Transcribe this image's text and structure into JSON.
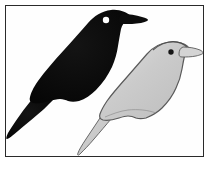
{
  "figure": {
    "caption": "",
    "background_color": "#ffffff",
    "plate_background_color": "#fefefe",
    "frame": {
      "border_color": "#2a2a2a",
      "border_width_px": 1,
      "x": 5,
      "y": 5,
      "width": 199,
      "height": 152
    }
  },
  "subjects": [
    {
      "id": "dark-bird",
      "label": "Dark bird silhouette",
      "fill_color": "#0c0c0c",
      "outline_color": "#0c0c0c",
      "eye_color": "#ffffff",
      "eye_cx": 108,
      "eye_cy": 19,
      "eye_r": 3.1,
      "facing": "right",
      "position": "upper-left",
      "body_path": "M 131 16 C 126 11 118 8 110 9 C 101 10 93 15 87 22 C 80 30 72 39 63 49 C 53 60 44 70 37 80 C 32 87 30 92 28 96 C 26 100 22 104 17 110 C 13 115 10 120 8 125 C 6 129 5 133 5 136 C 5 138 6 139 8 138 C 12 136 18 131 24 126 C 31 120 38 114 44 109 C 49 105 53 102 57 100 C 60 99 63 98 66 98 C 68 98 70 99 72 100 C 75 101 78 101 82 100 C 88 98 94 94 99 89 C 106 82 111 74 115 66 C 118 59 120 52 121 45 C 122 39 123 33 124 28 C 125 24 127 21 131 19 L 131 16 Z",
      "beak_path": "M 126 13 C 132 13 139 14 145 16 C 149 17 151 18 151 19 C 151 20 148 21 144 22 C 138 23 132 23 127 23 C 124 23 122 22 122 20 C 122 17 123 14 126 13 Z"
    },
    {
      "id": "light-bird",
      "label": "Light bird outline",
      "fill_color": "#cfcfcf",
      "outline_color": "#5a5a5a",
      "eye_color": "#151515",
      "eye_cx": 169,
      "eye_cy": 50,
      "eye_r": 2.6,
      "facing": "right",
      "position": "lower-right",
      "body_path": "M 186 48 C 181 43 174 41 167 42 C 159 43 151 47 145 53 C 139 60 132 68 125 76 C 117 85 110 93 105 100 C 101 106 99 110 97 113 C 95 117 91 121 87 126 C 83 131 80 136 78 140 C 76 144 75 147 76 149 C 77 150 78 149 80 147 C 84 143 89 138 95 133 C 101 128 107 123 112 119 C 116 116 120 114 123 113 C 126 112 129 113 131 114 C 134 115 137 115 141 114 C 146 112 152 109 157 104 C 163 98 168 91 171 84 C 174 78 176 71 177 65 C 178 59 179 54 180 50 C 181 47 183 45 186 44 L 186 48 Z",
      "beak_path": "M 181 44 C 187 44 193 45 198 47 C 201 48 203 49 203 50 C 203 51 200 52 196 53 C 191 54 185 54 181 54 C 178 54 177 53 177 51 C 177 48 178 45 181 44 Z"
    }
  ],
  "colors": {
    "page_background": "#ffffff",
    "frame_border": "#2a2a2a",
    "dark_silhouette": "#0c0c0c",
    "light_silhouette_fill": "#cfcfcf",
    "light_silhouette_outline": "#5a5a5a",
    "dark_bird_eye": "#ffffff",
    "light_bird_eye": "#151515"
  }
}
